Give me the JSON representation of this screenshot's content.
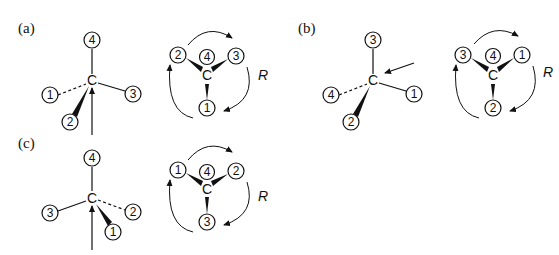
{
  "figure": {
    "panels": [
      {
        "label": "(a)",
        "center_atom": "C",
        "left_substituents": {
          "top": "4",
          "left_dashed": "1",
          "right": "3",
          "wedge_down_left": "2"
        },
        "right_projection": {
          "back": "4",
          "upper_left": "2",
          "upper_right": "3",
          "bottom": "1"
        },
        "rotation": "clockwise",
        "descriptor": "R"
      },
      {
        "label": "(b)",
        "center_atom": "C",
        "left_substituents": {
          "top": "3",
          "left_dashed": "4",
          "right": "1",
          "wedge_down_left": "2"
        },
        "right_projection": {
          "back": "4",
          "upper_left": "3",
          "upper_right": "1",
          "bottom": "2"
        },
        "rotation": "clockwise",
        "descriptor": "R"
      },
      {
        "label": "(c)",
        "center_atom": "C",
        "left_substituents": {
          "top": "4",
          "left": "3",
          "right_dashed": "2",
          "wedge_down_right": "1"
        },
        "right_projection": {
          "back": "4",
          "upper_left": "1",
          "upper_right": "2",
          "bottom": "3"
        },
        "rotation": "clockwise",
        "descriptor": "R"
      }
    ]
  },
  "colors": {
    "ink": "#111111",
    "background": "#ffffff"
  }
}
